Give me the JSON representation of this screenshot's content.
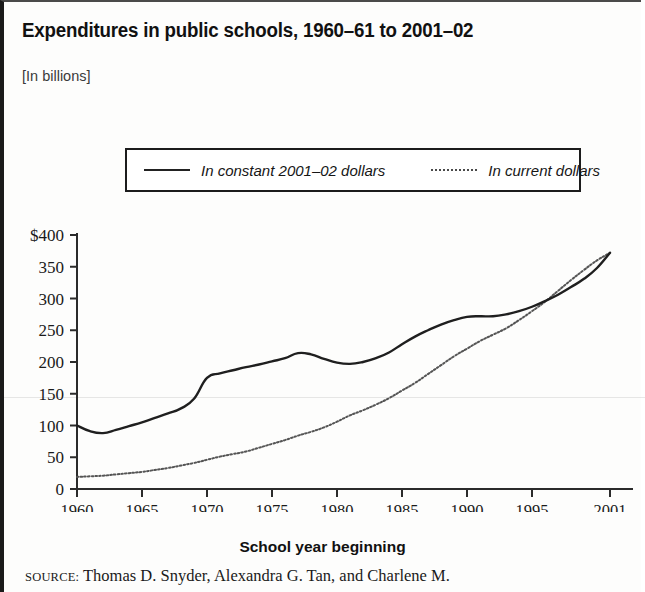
{
  "header": {
    "title": "Expenditures in public schools, 1960–61 to 2001–02",
    "units": "[In billions]"
  },
  "legend": {
    "position": "top-center",
    "entries": [
      {
        "marker": "solid-line-swatch",
        "label": "In constant 2001–02 dollars"
      },
      {
        "marker": "dotted-line-swatch",
        "label": "In current dollars"
      }
    ]
  },
  "axes": {
    "x_title": "School year beginning",
    "x_ticks": [
      "1960",
      "1965",
      "1970",
      "1975",
      "1980",
      "1985",
      "1990",
      "1995",
      "2001"
    ],
    "y_ticks": [
      "$400",
      "350",
      "300",
      "250",
      "200",
      "150",
      "100",
      "50",
      "0"
    ]
  },
  "source": {
    "label": "SOURCE:",
    "text": " Thomas D. Snyder, Alexandra G. Tan, and Charlene M."
  },
  "colors": {
    "constant_dollars_line": "#1f1f1f",
    "current_dollars_line": "#555555",
    "axis": "#2b2b2b",
    "frame": "#1a1a1a",
    "background": "#fdfdfc"
  },
  "chart_data": {
    "type": "line",
    "title": "Expenditures in public schools, 1960–61 to 2001–02",
    "subtitle": "[In billions]",
    "xlabel": "School year beginning",
    "ylabel": "",
    "xlim": [
      1960,
      2001
    ],
    "ylim": [
      0,
      400
    ],
    "ytick_values": [
      0,
      50,
      100,
      150,
      200,
      250,
      300,
      350,
      400
    ],
    "xtick_values": [
      1960,
      1965,
      1970,
      1975,
      1980,
      1985,
      1990,
      1995,
      2001
    ],
    "grid": false,
    "legend_position": "top-center",
    "x": [
      1960,
      1961,
      1962,
      1963,
      1964,
      1965,
      1966,
      1967,
      1968,
      1969,
      1970,
      1971,
      1972,
      1973,
      1974,
      1975,
      1976,
      1977,
      1978,
      1979,
      1980,
      1981,
      1982,
      1983,
      1984,
      1985,
      1986,
      1987,
      1988,
      1989,
      1990,
      1991,
      1992,
      1993,
      1994,
      1995,
      1996,
      1997,
      1998,
      1999,
      2000,
      2001
    ],
    "series": [
      {
        "name": "In constant 2001–02 dollars",
        "style": "solid",
        "values": [
          100,
          91,
          88,
          93,
          99,
          105,
          112,
          119,
          127,
          142,
          175,
          182,
          187,
          192,
          196,
          201,
          206,
          214,
          212,
          205,
          199,
          197,
          200,
          206,
          215,
          228,
          240,
          250,
          259,
          266,
          271,
          272,
          272,
          275,
          280,
          287,
          296,
          306,
          318,
          331,
          348,
          372
        ]
      },
      {
        "name": "In current dollars",
        "style": "dotted",
        "values": [
          19,
          20,
          21,
          23,
          25,
          27,
          30,
          33,
          37,
          41,
          46,
          51,
          55,
          59,
          65,
          71,
          77,
          84,
          90,
          97,
          106,
          116,
          124,
          133,
          143,
          155,
          167,
          181,
          195,
          209,
          221,
          233,
          243,
          253,
          266,
          280,
          295,
          312,
          329,
          345,
          360,
          372
        ]
      }
    ]
  }
}
